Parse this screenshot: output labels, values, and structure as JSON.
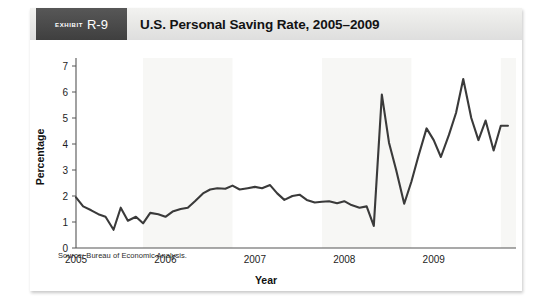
{
  "exhibit": {
    "label": "exhibit",
    "number": "R-9",
    "title": "U.S. Personal Saving Rate, 2005–2009"
  },
  "source_note": "Source: Bureau of Economic Analysis.",
  "chart_data": {
    "type": "line",
    "title": "U.S. Personal Saving Rate, 2005–2009",
    "xlabel": "Year",
    "ylabel": "Percentage",
    "ylim": [
      0,
      7
    ],
    "yticks": [
      "0",
      "1",
      "2",
      "3",
      "4",
      "5",
      "6",
      "7"
    ],
    "xlim": [
      2005.0,
      2009.92
    ],
    "xticks": [
      "2005",
      "2006",
      "2007",
      "2008",
      "2009"
    ],
    "xtick_values": [
      2005,
      2006,
      2007,
      2008,
      2009
    ],
    "grid": false,
    "legend": null,
    "line_color": "#3a3a3a",
    "band_color": "#f7f7f5",
    "shaded_bands": [
      [
        2005.75,
        2006.75
      ],
      [
        2007.75,
        2008.75
      ],
      [
        2009.75,
        2009.92
      ]
    ],
    "series": [
      {
        "name": "Personal Saving Rate",
        "x": [
          2005.0,
          2005.08,
          2005.17,
          2005.25,
          2005.33,
          2005.42,
          2005.5,
          2005.58,
          2005.67,
          2005.75,
          2005.83,
          2005.92,
          2006.0,
          2006.08,
          2006.17,
          2006.25,
          2006.33,
          2006.42,
          2006.5,
          2006.58,
          2006.67,
          2006.75,
          2006.83,
          2006.92,
          2007.0,
          2007.08,
          2007.17,
          2007.25,
          2007.33,
          2007.42,
          2007.5,
          2007.58,
          2007.67,
          2007.75,
          2007.83,
          2007.92,
          2008.0,
          2008.08,
          2008.17,
          2008.25,
          2008.33,
          2008.42,
          2008.5,
          2008.58,
          2008.67,
          2008.75,
          2008.83,
          2008.92,
          2009.0,
          2009.08,
          2009.17,
          2009.25,
          2009.33,
          2009.42,
          2009.5,
          2009.58,
          2009.67,
          2009.75,
          2009.83
        ],
        "values": [
          1.95,
          1.6,
          1.45,
          1.3,
          1.2,
          0.7,
          1.55,
          1.05,
          1.2,
          0.95,
          1.35,
          1.3,
          1.2,
          1.4,
          1.5,
          1.55,
          1.8,
          2.1,
          2.25,
          2.3,
          2.28,
          2.4,
          2.25,
          2.3,
          2.35,
          2.3,
          2.42,
          2.1,
          1.85,
          2.0,
          2.05,
          1.85,
          1.75,
          1.78,
          1.8,
          1.72,
          1.8,
          1.65,
          1.55,
          1.6,
          0.85,
          5.9,
          4.05,
          3.0,
          1.7,
          2.55,
          3.55,
          4.6,
          4.15,
          3.5,
          4.35,
          5.2,
          6.5,
          5.0,
          4.15,
          4.9,
          3.75,
          4.7,
          4.7
        ]
      }
    ],
    "annotations": []
  }
}
